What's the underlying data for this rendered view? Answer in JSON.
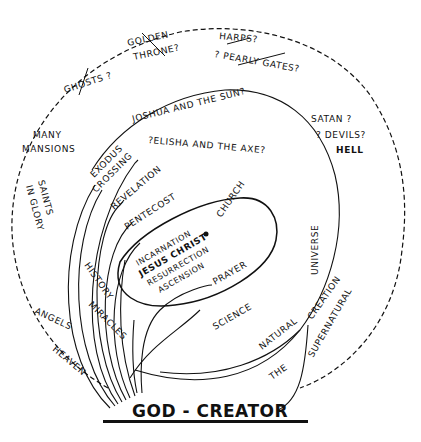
{
  "diagram": {
    "title": "GOD - CREATOR",
    "outer_ring": {
      "labels": {
        "golden": "GOLDEN",
        "throne": "THRONE?",
        "harps": "HARPS?",
        "pearly_gates": "? PEARLY GATES?",
        "ghosts": "GHOSTS ?",
        "many": "MANY",
        "mansions": "MANSIONS",
        "saints": "SAINTS",
        "in_glory": "IN GLORY",
        "satan": "SATAN ?",
        "devils": "? DEVILS?",
        "hell": "HELL",
        "angels": "ANGELS",
        "heaven": "HEAVEN",
        "supernatural": "SUPERNATURAL",
        "the": "THE"
      }
    },
    "inner_ring": {
      "labels": {
        "joshua": "JOSHUA AND THE SUN?",
        "elisha": "?ELISHA AND THE AXE?",
        "natural": "NATURAL",
        "universe": "UNIVERSE",
        "science": "SCIENCE",
        "creation": "CREATION"
      }
    },
    "arrows": {
      "exodus": "EXODUS",
      "crossing": "CROSSING",
      "revelation": "REVELATION",
      "pentecost": "PENTECOST",
      "history": "HISTORY",
      "miracles": "MIRACLES",
      "prayer": "PRAYER"
    },
    "center": {
      "church": "CHURCH",
      "incarnation": "INCARNATION",
      "jesus_christ": "JESUS CHRIST",
      "resurrection": "RESURRECTION",
      "ascension": "ASCENSION"
    },
    "colors": {
      "ink": "#111111",
      "paper": "#ffffff"
    }
  }
}
